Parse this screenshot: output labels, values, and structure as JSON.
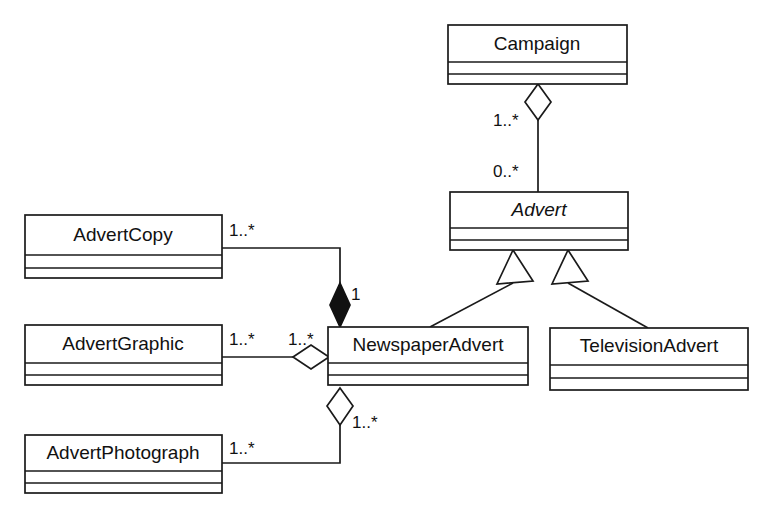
{
  "diagram": {
    "kind": "uml-class-diagram",
    "background_color": "#ffffff",
    "line_color": "#1a1a1a",
    "text_color": "#111111"
  },
  "classes": {
    "campaign": {
      "name": "Campaign",
      "abstract": false
    },
    "advert": {
      "name": "Advert",
      "abstract": true
    },
    "newspaper_advert": {
      "name": "NewspaperAdvert",
      "abstract": false
    },
    "television_advert": {
      "name": "TelevisionAdvert",
      "abstract": false
    },
    "advert_copy": {
      "name": "AdvertCopy",
      "abstract": false
    },
    "advert_graphic": {
      "name": "AdvertGraphic",
      "abstract": false
    },
    "advert_photograph": {
      "name": "AdvertPhotograph",
      "abstract": false
    }
  },
  "multiplicities": {
    "campaign_end": "1..*",
    "advert_end": "0..*",
    "advert_copy_end": "1..*",
    "newspaper_copy_end": "1",
    "advert_graphic_end": "1..*",
    "newspaper_graphic_end": "1..*",
    "advert_photograph_end": "1..*",
    "newspaper_photograph_end": "1..*"
  },
  "relationships": [
    {
      "id": "campaign-advert",
      "type": "aggregation",
      "from": "Campaign",
      "to": "Advert",
      "from_mult": "1..*",
      "to_mult": "0..*"
    },
    {
      "id": "advert-newspaper",
      "type": "generalization",
      "from": "NewspaperAdvert",
      "to": "Advert"
    },
    {
      "id": "advert-television",
      "type": "generalization",
      "from": "TelevisionAdvert",
      "to": "Advert"
    },
    {
      "id": "newspaper-copy",
      "type": "composition",
      "from": "NewspaperAdvert",
      "to": "AdvertCopy",
      "from_mult": "1",
      "to_mult": "1..*"
    },
    {
      "id": "newspaper-graphic",
      "type": "aggregation",
      "from": "NewspaperAdvert",
      "to": "AdvertGraphic",
      "from_mult": "1..*",
      "to_mult": "1..*"
    },
    {
      "id": "newspaper-photograph",
      "type": "aggregation",
      "from": "NewspaperAdvert",
      "to": "AdvertPhotograph",
      "from_mult": "1..*",
      "to_mult": "1..*"
    }
  ]
}
